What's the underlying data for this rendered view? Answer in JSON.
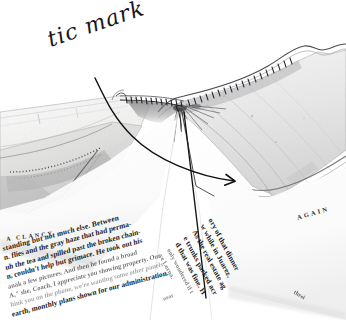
{
  "image": {
    "kind": "photograph-scan",
    "subject": "open-book-spine-gutter-closeup",
    "background_color": "#ffffff",
    "ink_color": "#16161a",
    "paper_color": "#f4f4f3",
    "pencil_color": "#8d8d92",
    "width": 346,
    "height": 320
  },
  "annotation": {
    "label": "tic mark",
    "handwriting_color": "#16161a",
    "rotation_degrees": -19,
    "leaders": [
      {
        "name": "curved-leader-arrow",
        "from": [
          95,
          78
        ],
        "to": [
          237,
          181
        ],
        "has_arrowhead": true
      },
      {
        "name": "straight-leader-line",
        "from": [
          186,
          112
        ],
        "to": [
          206,
          298
        ],
        "has_arrowhead": false
      }
    ]
  },
  "book": {
    "description": "Open book seen from the head edge, showing the sewn gutter",
    "features": [
      {
        "name": "spine-gutter",
        "label": "gutter"
      },
      {
        "name": "sewn-tic-marks",
        "label": "tic mark stitching along folded signature"
      },
      {
        "name": "left-page-block",
        "label": "left page"
      },
      {
        "name": "right-page-block",
        "label": "right page"
      },
      {
        "name": "head-edge",
        "label": "head edge of text block"
      }
    ]
  },
  "left_page": {
    "running_head": "A CLANCY",
    "lines": [
      "standing but not much else. Between",
      "n. flies and the gray haze that had perma-",
      "uh the tea and spilled past the broken chain-",
      "n, couldn't help but grimace. He took out his",
      "anak a few pictures. And then he found a broad",
      "A,\" she, Coach, I appreciate you showing property. Our",
      "hink you on the phone, we're wanting some other panels",
      "earth, monthly plans shown for our administration."
    ],
    "folio": "near"
  },
  "right_page": {
    "running_head": "AGAIN",
    "lines": [
      "ory of that dinner",
      "w while in Juarez.",
      "As the real estate ag",
      "e trunks parked acr",
      "d that was fine. H",
      "only wondered if t",
      "ve Lorna."
    ],
    "folio": "threi"
  }
}
